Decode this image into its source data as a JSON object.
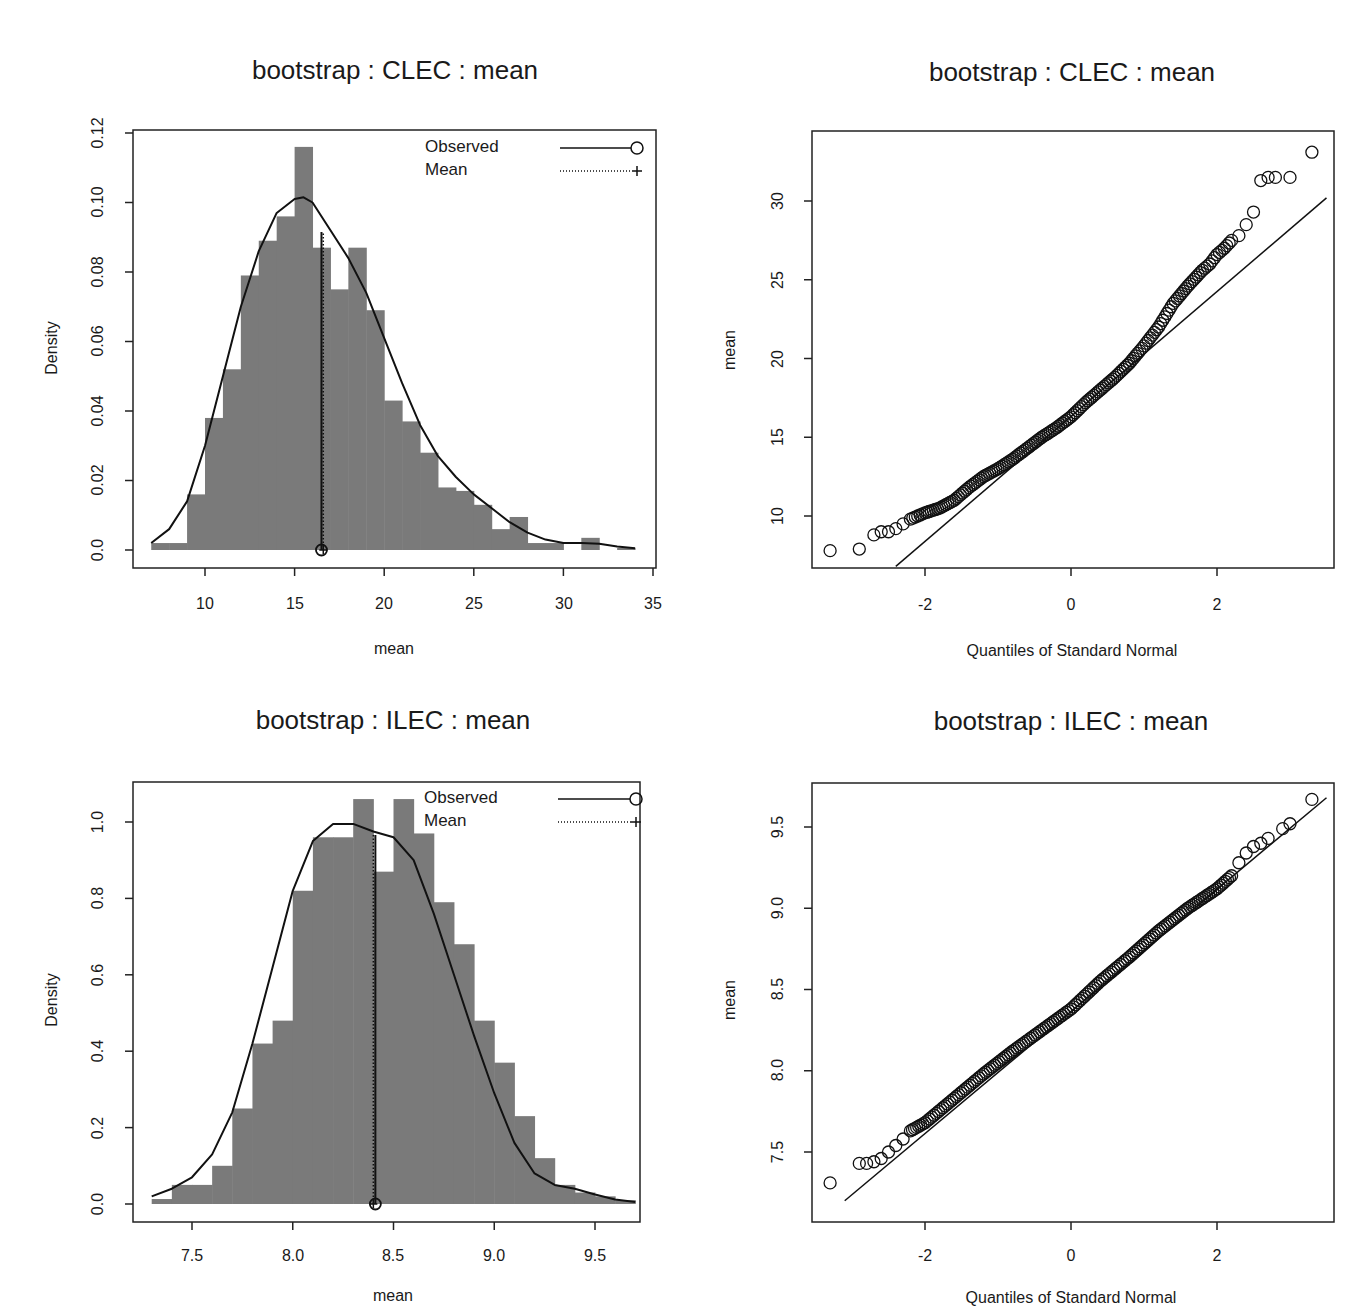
{
  "panels": {
    "hist_clec": {
      "title": "bootstrap : CLEC : mean",
      "xlabel": "mean",
      "ylabel": "Density",
      "xticks": [
        "10",
        "15",
        "20",
        "25",
        "30",
        "35"
      ],
      "yticks": [
        "0.0",
        "0.02",
        "0.04",
        "0.06",
        "0.08",
        "0.10",
        "0.12"
      ],
      "legend": {
        "observed": "Observed",
        "mean": "Mean"
      }
    },
    "qq_clec": {
      "title": "bootstrap : CLEC : mean",
      "xlabel": "Quantiles of Standard Normal",
      "ylabel": "mean",
      "xticks": [
        "-2",
        "0",
        "2"
      ],
      "yticks": [
        "10",
        "15",
        "20",
        "25",
        "30"
      ]
    },
    "hist_ilec": {
      "title": "bootstrap : ILEC : mean",
      "xlabel": "mean",
      "ylabel": "Density",
      "xticks": [
        "7.5",
        "8.0",
        "8.5",
        "9.0",
        "9.5"
      ],
      "yticks": [
        "0.0",
        "0.2",
        "0.4",
        "0.6",
        "0.8",
        "1.0"
      ],
      "legend": {
        "observed": "Observed",
        "mean": "Mean"
      }
    },
    "qq_ilec": {
      "title": "bootstrap : ILEC : mean",
      "xlabel": "Quantiles of Standard Normal",
      "ylabel": "mean",
      "xticks": [
        "-2",
        "0",
        "2"
      ],
      "yticks": [
        "7.5",
        "8.0",
        "8.5",
        "9.0",
        "9.5"
      ]
    }
  },
  "colors": {
    "bar": "#7a7a7a",
    "line": "#111111",
    "axis": "#222222"
  },
  "chart_data": [
    {
      "type": "bar",
      "title": "bootstrap : CLEC : mean",
      "xlabel": "mean",
      "ylabel": "Density",
      "xlim": [
        7,
        35
      ],
      "ylim": [
        0,
        0.12
      ],
      "bin_width": 1,
      "bin_starts": [
        7,
        8,
        9,
        10,
        11,
        12,
        13,
        14,
        15,
        16,
        17,
        18,
        19,
        20,
        21,
        22,
        23,
        24,
        25,
        26,
        27,
        28,
        29,
        30,
        31,
        32,
        33
      ],
      "values": [
        0.002,
        0.002,
        0.016,
        0.038,
        0.052,
        0.079,
        0.089,
        0.096,
        0.116,
        0.087,
        0.075,
        0.087,
        0.069,
        0.043,
        0.037,
        0.028,
        0.018,
        0.017,
        0.013,
        0.006,
        0.0095,
        0.002,
        0.002,
        0,
        0.0035,
        0,
        0.0006
      ],
      "density_curve": {
        "x": [
          7,
          8,
          9,
          10,
          11,
          12,
          13,
          14,
          15,
          15.5,
          16,
          17,
          18,
          19,
          20,
          21,
          22,
          23,
          24,
          25,
          26,
          27,
          28,
          29,
          30,
          31,
          32,
          33,
          34
        ],
        "y": [
          0.002,
          0.006,
          0.014,
          0.03,
          0.05,
          0.07,
          0.086,
          0.097,
          0.101,
          0.1015,
          0.1,
          0.092,
          0.084,
          0.074,
          0.061,
          0.048,
          0.036,
          0.027,
          0.021,
          0.016,
          0.012,
          0.008,
          0.005,
          0.003,
          0.002,
          0.002,
          0.0018,
          0.001,
          0.0005
        ]
      },
      "observed": 16.5,
      "mean": 16.6,
      "legend": [
        "Observed (solid line, circle)",
        "Mean (dotted line, plus)"
      ],
      "legend_position": "top-right",
      "grid": false
    },
    {
      "type": "scatter",
      "title": "bootstrap : CLEC : mean",
      "xlabel": "Quantiles of Standard Normal",
      "ylabel": "mean",
      "xlim": [
        -3.5,
        3.5
      ],
      "ylim": [
        7,
        34
      ],
      "reference_line": {
        "x": [
          -2.4,
          3.5
        ],
        "y": [
          6.8,
          30.2
        ]
      },
      "x": [
        -3.3,
        -2.9,
        -2.7,
        -2.6,
        -2.5,
        -2.4,
        -2.3,
        -2.2,
        -2.1,
        -2.0,
        -1.8,
        -1.6,
        -1.4,
        -1.2,
        -1.0,
        -0.8,
        -0.6,
        -0.4,
        -0.2,
        0,
        0.2,
        0.4,
        0.6,
        0.8,
        1.0,
        1.2,
        1.4,
        1.6,
        1.8,
        1.9,
        2.0,
        2.1,
        2.2,
        2.3,
        2.4,
        2.5,
        2.6,
        2.7,
        2.8,
        3.0,
        3.3
      ],
      "y": [
        7.8,
        7.9,
        8.8,
        9.0,
        9.0,
        9.2,
        9.5,
        9.8,
        10.0,
        10.2,
        10.5,
        11.0,
        11.8,
        12.5,
        13.0,
        13.6,
        14.3,
        15.0,
        15.6,
        16.3,
        17.2,
        18.0,
        18.8,
        19.7,
        20.8,
        22.0,
        23.5,
        24.6,
        25.6,
        26.0,
        26.6,
        27.0,
        27.5,
        27.8,
        28.5,
        29.3,
        31.3,
        31.5,
        31.5,
        31.5,
        33.1
      ]
    },
    {
      "type": "bar",
      "title": "bootstrap : ILEC : mean",
      "xlabel": "mean",
      "ylabel": "Density",
      "xlim": [
        7.3,
        9.7
      ],
      "ylim": [
        0,
        1.1
      ],
      "bin_width": 0.1,
      "bin_starts": [
        7.3,
        7.4,
        7.5,
        7.6,
        7.7,
        7.8,
        7.9,
        8.0,
        8.1,
        8.2,
        8.3,
        8.4,
        8.5,
        8.6,
        8.7,
        8.8,
        8.9,
        9.0,
        9.1,
        9.2,
        9.3,
        9.4,
        9.5,
        9.6
      ],
      "values": [
        0.013,
        0.05,
        0.05,
        0.1,
        0.25,
        0.42,
        0.48,
        0.82,
        0.96,
        0.96,
        1.06,
        0.87,
        1.06,
        0.97,
        0.79,
        0.68,
        0.48,
        0.37,
        0.23,
        0.12,
        0.05,
        0.03,
        0.02,
        0.01
      ],
      "density_curve": {
        "x": [
          7.3,
          7.4,
          7.5,
          7.6,
          7.7,
          7.8,
          7.9,
          8.0,
          8.1,
          8.2,
          8.3,
          8.4,
          8.5,
          8.6,
          8.7,
          8.8,
          8.9,
          9.0,
          9.1,
          9.2,
          9.3,
          9.4,
          9.5,
          9.6,
          9.7
        ],
        "y": [
          0.02,
          0.04,
          0.07,
          0.13,
          0.24,
          0.42,
          0.62,
          0.82,
          0.95,
          0.995,
          0.995,
          0.975,
          0.96,
          0.9,
          0.76,
          0.6,
          0.44,
          0.29,
          0.16,
          0.08,
          0.05,
          0.04,
          0.025,
          0.012,
          0.005
        ]
      },
      "observed": 8.41,
      "mean": 8.4,
      "legend": [
        "Observed (solid line, circle)",
        "Mean (dotted line, plus)"
      ],
      "legend_position": "top-right",
      "grid": false
    },
    {
      "type": "scatter",
      "title": "bootstrap : ILEC : mean",
      "xlabel": "Quantiles of Standard Normal",
      "ylabel": "mean",
      "xlim": [
        -3.5,
        3.5
      ],
      "ylim": [
        7.22,
        9.77
      ],
      "reference_line": {
        "x": [
          -3.1,
          3.5
        ],
        "y": [
          7.2,
          9.68
        ]
      },
      "x": [
        -3.3,
        -2.9,
        -2.8,
        -2.7,
        -2.6,
        -2.5,
        -2.4,
        -2.3,
        -2.2,
        -2.0,
        -1.6,
        -1.2,
        -0.8,
        -0.4,
        0,
        0.4,
        0.8,
        1.2,
        1.6,
        1.8,
        2.0,
        2.2,
        2.3,
        2.4,
        2.5,
        2.6,
        2.7,
        2.9,
        3.0,
        3.3
      ],
      "y": [
        7.31,
        7.43,
        7.43,
        7.44,
        7.46,
        7.5,
        7.54,
        7.58,
        7.63,
        7.68,
        7.83,
        7.98,
        8.12,
        8.25,
        8.38,
        8.55,
        8.7,
        8.86,
        9.0,
        9.06,
        9.12,
        9.2,
        9.28,
        9.34,
        9.38,
        9.4,
        9.43,
        9.49,
        9.52,
        9.67
      ]
    }
  ]
}
